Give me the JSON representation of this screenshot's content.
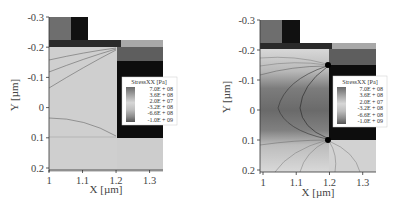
{
  "chart_data": [
    {
      "type": "heatmap",
      "title": "",
      "xlabel": "X [µm]",
      "ylabel": "Y [µm]",
      "xlim": [
        1,
        1.34
      ],
      "ylim": [
        -0.3,
        0.2
      ],
      "x_ticks": [
        "1",
        "1.1",
        "1.2",
        "1.3"
      ],
      "x_tick_values": [
        1,
        1.1,
        1.2,
        1.3
      ],
      "y_ticks": [
        "-0.3",
        "-0.2",
        "-0.1",
        "0",
        "0.1",
        "0.2"
      ],
      "y_tick_values": [
        -0.3,
        -0.2,
        -0.1,
        0,
        0.1,
        0.2
      ],
      "y_inverted": true,
      "legend": {
        "title": "StressXX [Pa]",
        "placement": "right",
        "entries": [
          "7.0E + 08",
          "3.6E + 08",
          "2.0E + 07",
          "-3.2E + 08",
          "-6.6E + 08",
          "-1.0E + 09"
        ],
        "values": [
          700000000,
          360000000,
          20000000,
          -320000000,
          -660000000,
          -1000000000
        ]
      },
      "field_description": "Low stress gradient, mostly near-zero (light grey) in channel region; weak contour lines"
    },
    {
      "type": "heatmap",
      "title": "",
      "xlabel": "X [µm]",
      "ylabel": "Y [µm]",
      "xlim": [
        1,
        1.34
      ],
      "ylim": [
        -0.3,
        0.2
      ],
      "x_ticks": [
        "1",
        "1.1",
        "1.2",
        "1.3"
      ],
      "x_tick_values": [
        1,
        1.1,
        1.2,
        1.3
      ],
      "y_ticks": [
        "-0.3",
        "-0.2",
        "-0.1",
        "0",
        "0.1",
        "0.2"
      ],
      "y_tick_values": [
        -0.3,
        -0.2,
        -0.1,
        0,
        0.1,
        0.2
      ],
      "y_inverted": true,
      "legend": {
        "title": "StressXX [Pa]",
        "placement": "right",
        "entries": [
          "7.0E + 08",
          "3.6E + 08",
          "2.0E + 07",
          "-3.2E + 08",
          "-6.6E + 08",
          "-1.0E + 09"
        ],
        "values": [
          700000000,
          360000000,
          20000000,
          -320000000,
          -660000000,
          -1000000000
        ]
      },
      "field_description": "Strong compressive stress (dark) concentrated in channel between y=-0.1 and 0.1 with fanning contours from corners at x=1.2"
    }
  ]
}
